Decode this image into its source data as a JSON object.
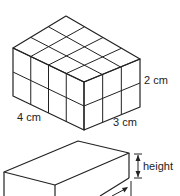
{
  "figure": {
    "cuboid_of_cubes": {
      "cubes_length": 4,
      "cubes_width": 3,
      "cubes_height": 2,
      "labels": {
        "length": "4 cm",
        "width": "3 cm",
        "height": "2 cm"
      }
    },
    "plain_cuboid": {
      "labels": {
        "height": "height"
      }
    }
  }
}
